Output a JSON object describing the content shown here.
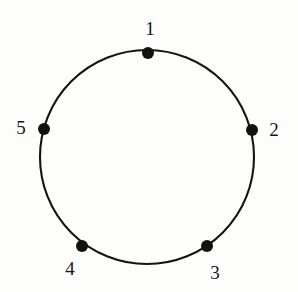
{
  "figure": {
    "kind": "cycle-graph-diagram",
    "background_color": "#fdfdfc",
    "stroke_color": "#141414",
    "dot_color": "#111111",
    "label_color": "#161616",
    "circle": {
      "center_x": 147,
      "center_y": 157,
      "radius": 107,
      "stroke_width": 2.1
    },
    "dot_radius": 6.0,
    "vertices": [
      {
        "label": "1",
        "angle_deg": 90,
        "dot_x": 148,
        "dot_y": 53,
        "label_x": 150,
        "label_y": 28
      },
      {
        "label": "2",
        "angle_deg": 15,
        "dot_x": 252,
        "dot_y": 130,
        "label_x": 274,
        "label_y": 129
      },
      {
        "label": "3",
        "angle_deg": -56,
        "dot_x": 207,
        "dot_y": 246,
        "label_x": 215,
        "label_y": 272
      },
      {
        "label": "4",
        "angle_deg": 236,
        "dot_x": 82,
        "dot_y": 246,
        "label_x": 70,
        "label_y": 268
      },
      {
        "label": "5",
        "angle_deg": 165,
        "dot_x": 44,
        "dot_y": 129,
        "label_x": 21,
        "label_y": 127
      }
    ]
  }
}
